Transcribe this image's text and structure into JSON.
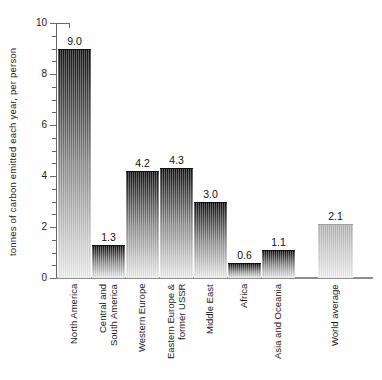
{
  "chart_data": {
    "type": "bar",
    "title": "",
    "xlabel": "",
    "ylabel": "tonnes of carbon emitted each year, per person",
    "ylim": [
      0,
      10
    ],
    "ytick_major": [
      0,
      2,
      4,
      6,
      8,
      10
    ],
    "ytick_minor_step": 0.5,
    "grid": false,
    "legend": "none",
    "categories": [
      "North America",
      "Central and South America",
      "Western Europe",
      "Eastern Europe & former USSR",
      "Middle East",
      "Africa",
      "Asia and Oceania",
      "World average"
    ],
    "category_display_lines": [
      [
        "North America"
      ],
      [
        "Central and",
        "South America"
      ],
      [
        "Western Europe"
      ],
      [
        "Eastern Europe &",
        "former USSR"
      ],
      [
        "Middle East"
      ],
      [
        "Africa"
      ],
      [
        "Asia and Oceania"
      ],
      [
        "World average"
      ]
    ],
    "values": [
      9.0,
      1.3,
      4.2,
      4.3,
      3.0,
      0.6,
      1.1,
      2.1
    ],
    "value_labels": [
      "9.0",
      "1.3",
      "4.2",
      "4.3",
      "3.0",
      "0.6",
      "1.1",
      "2.1"
    ],
    "last_bar_separated": true,
    "colors": {
      "bar_gradient_top": "#141414",
      "bar_gradient_mid": "#8c8c8c",
      "bar_gradient_bottom": "#ededed",
      "world_avg_gradient_top": "#b2b2b2",
      "world_avg_gradient_bottom": "#ededed",
      "axis": "#666666",
      "baseline": "#8f8f8f",
      "text": "#1a1a1a"
    }
  }
}
